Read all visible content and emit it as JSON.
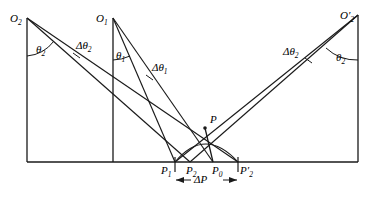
{
  "figure": {
    "type": "geometric-ray-diagram",
    "background_color": "#ffffff",
    "stroke_color": "#1a1a1a",
    "baseline_y": 162,
    "labels": {
      "apex_left": {
        "base": "O",
        "sub": "2",
        "prime": false,
        "x": 10,
        "y": 13
      },
      "apex_center": {
        "base": "O",
        "sub": "1",
        "prime": false,
        "x": 96,
        "y": 13
      },
      "apex_right": {
        "base": "O",
        "sub": "2",
        "prime": true,
        "x": 340,
        "y": 10
      },
      "angle_left": {
        "base": "θ",
        "sub": "2",
        "x": 36,
        "y": 44
      },
      "angle_center": {
        "base": "θ",
        "sub": "1",
        "x": 116,
        "y": 50
      },
      "angle_right": {
        "base": "θ",
        "sub": "2",
        "x": 336,
        "y": 52
      },
      "delta_angle_left": {
        "base": "Δθ",
        "sub": "2",
        "x": 76,
        "y": 40
      },
      "delta_angle_center": {
        "base": "Δθ",
        "sub": "1",
        "x": 152,
        "y": 62
      },
      "delta_angle_right": {
        "base": "Δθ",
        "sub": "2",
        "x": 283,
        "y": 46
      },
      "point_p": {
        "base": "P",
        "sub": "",
        "x": 210,
        "y": 114
      },
      "point_p1": {
        "base": "P",
        "sub": "1",
        "prime": false,
        "x": 161,
        "y": 165
      },
      "point_p2": {
        "base": "P",
        "sub": "2",
        "prime": false,
        "x": 186,
        "y": 165
      },
      "point_p0": {
        "base": "P",
        "sub": "0",
        "prime": false,
        "x": 212,
        "y": 165
      },
      "point_p2_prime": {
        "base": "P",
        "sub": "2",
        "prime": true,
        "x": 240,
        "y": 165
      },
      "delta_p": {
        "base": "ΔP",
        "sub": "",
        "x": 194,
        "y": 180
      }
    },
    "geometry": {
      "left_station_x": 27,
      "center_station_x": 113,
      "right_station_x": 358,
      "apex_left_y": 18,
      "apex_center_y": 18,
      "apex_right_y": 15,
      "target_point": {
        "x": 205,
        "y": 128
      },
      "tick_p1_x": 175,
      "tick_p2_x": 190,
      "tick_p0_x": 213,
      "tick_p2p_x": 238,
      "delta_p_arrow_left_x": 175,
      "delta_p_arrow_right_x": 238,
      "delta_p_arrow_y": 176
    }
  }
}
